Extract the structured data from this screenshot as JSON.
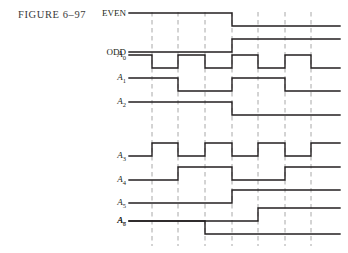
{
  "figure": {
    "caption": "FIGURE  6–97",
    "background": "#ffffff",
    "trace_color": "#231f20",
    "grid_color": "#a8a8a8"
  },
  "geometry": {
    "width": 348,
    "height": 253,
    "wave_left": 129,
    "wave_right": 340,
    "label_right": 126,
    "amplitude": 13,
    "gridlines_x": [
      152,
      178,
      205,
      232,
      258,
      285,
      311
    ],
    "grid_top": 12,
    "grid_bottom": 246
  },
  "signals": [
    {
      "name": "EVEN",
      "label": "EVEN",
      "italic": false,
      "baseline_y": 26,
      "initial": 1,
      "edges_x": [
        232
      ]
    },
    {
      "name": "ODD",
      "label": "ODD",
      "italic": false,
      "baseline_y": 52,
      "initial": 0,
      "edges_x": [
        232
      ]
    },
    {
      "name": "A0",
      "label": "A",
      "subscript": "0",
      "italic": true,
      "baseline_y": 68,
      "initial": 1,
      "edges_x": [
        152,
        178,
        205,
        232,
        258,
        285,
        311
      ]
    },
    {
      "name": "A1",
      "label": "A",
      "subscript": "1",
      "italic": true,
      "baseline_y": 91,
      "initial": 1,
      "edges_x": [
        178,
        232,
        285
      ]
    },
    {
      "name": "A2",
      "label": "A",
      "subscript": "2",
      "italic": true,
      "baseline_y": 115,
      "initial": 1,
      "edges_x": [
        232
      ]
    },
    {
      "name": "A3",
      "label": "A",
      "subscript": "3",
      "italic": true,
      "baseline_y": 156,
      "initial": 0,
      "edges_x": [
        152,
        178,
        205,
        232,
        258,
        285,
        311
      ]
    },
    {
      "name": "A4",
      "label": "A",
      "subscript": "4",
      "italic": true,
      "baseline_y": 180,
      "initial": 0,
      "edges_x": [
        178,
        232,
        285
      ]
    },
    {
      "name": "A5",
      "label": "A",
      "subscript": "5",
      "italic": true,
      "baseline_y": 203,
      "initial": 0,
      "edges_x": [
        232
      ]
    },
    {
      "name": "A6",
      "label": "A",
      "subscript": "6",
      "italic": true,
      "baseline_y": 221,
      "initial": 0,
      "edges_x": [
        258
      ]
    },
    {
      "name": "A7",
      "label": "A",
      "subscript": "7",
      "italic": true,
      "baseline_y": 234,
      "initial": 1,
      "edges_x": [
        205
      ]
    }
  ],
  "chart_data": {
    "type": "line",
    "title": "FIGURE  6–97",
    "xlabel": "",
    "ylabel": "",
    "x_gridlines": [
      152,
      178,
      205,
      232,
      258,
      285,
      311
    ],
    "series": [
      {
        "name": "EVEN",
        "initial_level": 1,
        "transitions": [
          232
        ],
        "levels": [
          1,
          0
        ]
      },
      {
        "name": "ODD",
        "initial_level": 0,
        "transitions": [
          232
        ],
        "levels": [
          0,
          1
        ]
      },
      {
        "name": "A0",
        "initial_level": 1,
        "transitions": [
          152,
          178,
          205,
          232,
          258,
          285,
          311
        ],
        "levels": [
          1,
          0,
          1,
          0,
          1,
          0,
          1,
          0
        ]
      },
      {
        "name": "A1",
        "initial_level": 1,
        "transitions": [
          178,
          232,
          285
        ],
        "levels": [
          1,
          0,
          1,
          0
        ]
      },
      {
        "name": "A2",
        "initial_level": 1,
        "transitions": [
          232
        ],
        "levels": [
          1,
          0
        ]
      },
      {
        "name": "A3",
        "initial_level": 0,
        "transitions": [
          152,
          178,
          205,
          232,
          258,
          285,
          311
        ],
        "levels": [
          0,
          1,
          0,
          1,
          0,
          1,
          0,
          1
        ]
      },
      {
        "name": "A4",
        "initial_level": 0,
        "transitions": [
          178,
          232,
          285
        ],
        "levels": [
          0,
          1,
          0,
          1
        ]
      },
      {
        "name": "A5",
        "initial_level": 0,
        "transitions": [
          232
        ],
        "levels": [
          0,
          1
        ]
      },
      {
        "name": "A6",
        "initial_level": 0,
        "transitions": [
          258
        ],
        "levels": [
          0,
          1
        ]
      },
      {
        "name": "A7",
        "initial_level": 1,
        "transitions": [
          205
        ],
        "levels": [
          1,
          0
        ]
      }
    ]
  }
}
